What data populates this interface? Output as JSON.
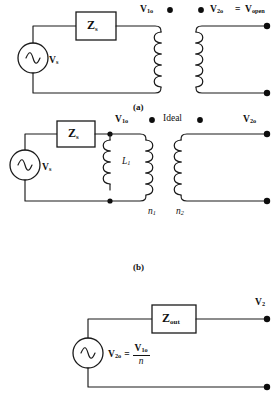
{
  "figure": {
    "colors": {
      "ink": "#1a1a1a",
      "background": "#ffffff",
      "dot": "#0d0d0d"
    },
    "panels": [
      {
        "id": "a",
        "caption": "(a)",
        "source_label": "V",
        "source_sub": "s",
        "impedance_label": "Z",
        "impedance_sub": "s",
        "primary_voltage": "V",
        "primary_voltage_sub": "1o",
        "secondary_voltage": "V",
        "secondary_voltage_sub": "2o",
        "equals_sign": "=",
        "open_voltage": "V",
        "open_voltage_sub": "open",
        "primary_turns": 6,
        "secondary_turns": 6,
        "dots": 2
      },
      {
        "id": "b",
        "caption": "(b)",
        "source_label": "V",
        "source_sub": "s",
        "impedance_label": "Z",
        "impedance_sub": "s",
        "primary_voltage": "V",
        "primary_voltage_sub": "1o",
        "secondary_voltage": "V",
        "secondary_voltage_sub": "2o",
        "ideal_label": "Ideal",
        "magnetizing_label": "L",
        "magnetizing_sub": "1",
        "primary_turns_label": "n",
        "primary_turns_sub": "1",
        "secondary_turns_label": "n",
        "secondary_turns_sub": "2",
        "dots": 2
      },
      {
        "id": "c",
        "caption": "",
        "source_label": "V",
        "source_sub": "2o",
        "equals_sign": "=",
        "numerator": "V",
        "numerator_sub": "1o",
        "denominator": "n",
        "impedance_label": "Z",
        "impedance_sub": "out",
        "terminal_voltage": "V",
        "terminal_voltage_sub": "2"
      }
    ]
  }
}
